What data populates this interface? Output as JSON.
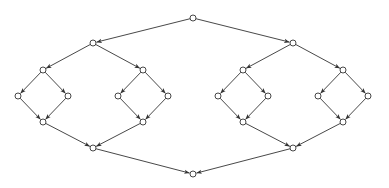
{
  "diagram": {
    "title": "",
    "type": "directed-graph",
    "stroke_color": "#333333",
    "node_fill": "#ffffff",
    "node_radius": 3,
    "nodes": [
      {
        "id": "top",
        "x": 193,
        "y": 18
      },
      {
        "id": "L1a",
        "x": 93,
        "y": 43
      },
      {
        "id": "L1b",
        "x": 293,
        "y": 43
      },
      {
        "id": "L2a",
        "x": 43,
        "y": 70
      },
      {
        "id": "L2b",
        "x": 143,
        "y": 70
      },
      {
        "id": "L2c",
        "x": 243,
        "y": 70
      },
      {
        "id": "L2d",
        "x": 343,
        "y": 70
      },
      {
        "id": "L3a",
        "x": 18,
        "y": 96
      },
      {
        "id": "L3b",
        "x": 68,
        "y": 96
      },
      {
        "id": "L3c",
        "x": 118,
        "y": 96
      },
      {
        "id": "L3d",
        "x": 168,
        "y": 96
      },
      {
        "id": "L3e",
        "x": 218,
        "y": 96
      },
      {
        "id": "L3f",
        "x": 268,
        "y": 96
      },
      {
        "id": "L3g",
        "x": 318,
        "y": 96
      },
      {
        "id": "L3h",
        "x": 368,
        "y": 96
      },
      {
        "id": "L4a",
        "x": 43,
        "y": 122
      },
      {
        "id": "L4b",
        "x": 143,
        "y": 122
      },
      {
        "id": "L4c",
        "x": 243,
        "y": 122
      },
      {
        "id": "L4d",
        "x": 343,
        "y": 122
      },
      {
        "id": "L5a",
        "x": 93,
        "y": 148
      },
      {
        "id": "L5b",
        "x": 293,
        "y": 148
      },
      {
        "id": "bottom",
        "x": 193,
        "y": 174
      }
    ],
    "edges": [
      [
        "top",
        "L1a"
      ],
      [
        "top",
        "L1b"
      ],
      [
        "L1a",
        "L2a"
      ],
      [
        "L1a",
        "L2b"
      ],
      [
        "L1b",
        "L2c"
      ],
      [
        "L1b",
        "L2d"
      ],
      [
        "L2a",
        "L3a"
      ],
      [
        "L2a",
        "L3b"
      ],
      [
        "L2b",
        "L3c"
      ],
      [
        "L2b",
        "L3d"
      ],
      [
        "L2c",
        "L3e"
      ],
      [
        "L2c",
        "L3f"
      ],
      [
        "L2d",
        "L3g"
      ],
      [
        "L2d",
        "L3h"
      ],
      [
        "L3a",
        "L4a"
      ],
      [
        "L3b",
        "L4a"
      ],
      [
        "L3c",
        "L4b"
      ],
      [
        "L3d",
        "L4b"
      ],
      [
        "L3e",
        "L4c"
      ],
      [
        "L3f",
        "L4c"
      ],
      [
        "L3g",
        "L4d"
      ],
      [
        "L3h",
        "L4d"
      ],
      [
        "L4a",
        "L5a"
      ],
      [
        "L4b",
        "L5a"
      ],
      [
        "L4c",
        "L5b"
      ],
      [
        "L4d",
        "L5b"
      ],
      [
        "L5a",
        "bottom"
      ],
      [
        "L5b",
        "bottom"
      ]
    ]
  }
}
